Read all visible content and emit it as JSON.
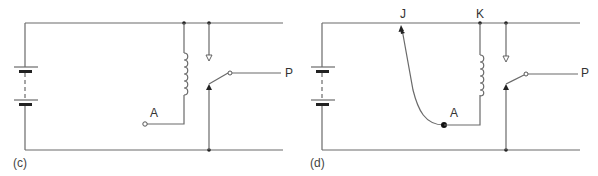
{
  "figure": {
    "panels": [
      {
        "caption": "(c)",
        "labels": {
          "terminal_a": "A",
          "output_p": "P"
        }
      },
      {
        "caption": "(d)",
        "labels": {
          "junction_j": "J",
          "junction_k": "K",
          "terminal_a": "A",
          "output_p": "P"
        }
      }
    ]
  },
  "colors": {
    "wire": "#6a6a6a",
    "text": "#333333",
    "background": "#ffffff"
  }
}
